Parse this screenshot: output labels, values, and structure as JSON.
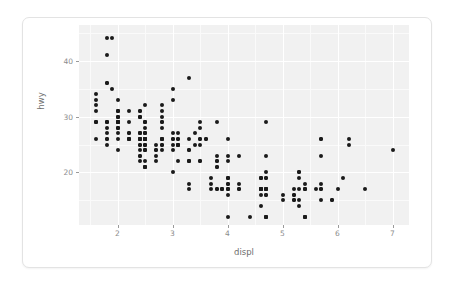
{
  "chart_data": {
    "type": "scatter",
    "title": "",
    "xlabel": "displ",
    "ylabel": "hwy",
    "xlim": [
      1.3,
      7.3
    ],
    "ylim": [
      10.6,
      46.4
    ],
    "xticks": [
      2,
      3,
      4,
      5,
      6,
      7
    ],
    "yticks": [
      20,
      30,
      40
    ],
    "xtick_labels": [
      "2",
      "3",
      "4",
      "5",
      "6",
      "7"
    ],
    "ytick_labels": [
      "20",
      "30",
      "40"
    ],
    "grid": true,
    "legend": "none",
    "panel_background": "#f1f1f1",
    "grid_color": "#ffffff",
    "point_color": "#1a1a1a",
    "point_count": 234,
    "points": [
      [
        1.8,
        29
      ],
      [
        1.8,
        29
      ],
      [
        2.0,
        31
      ],
      [
        2.0,
        30
      ],
      [
        2.8,
        26
      ],
      [
        2.8,
        26
      ],
      [
        3.1,
        27
      ],
      [
        1.8,
        26
      ],
      [
        1.8,
        25
      ],
      [
        2.0,
        28
      ],
      [
        2.0,
        27
      ],
      [
        2.8,
        25
      ],
      [
        2.8,
        25
      ],
      [
        3.1,
        25
      ],
      [
        3.1,
        25
      ],
      [
        2.8,
        24
      ],
      [
        3.1,
        25
      ],
      [
        4.2,
        23
      ],
      [
        5.3,
        20
      ],
      [
        5.3,
        15
      ],
      [
        5.3,
        20
      ],
      [
        5.7,
        17
      ],
      [
        6.0,
        17
      ],
      [
        5.7,
        26
      ],
      [
        5.7,
        23
      ],
      [
        6.2,
        26
      ],
      [
        6.2,
        25
      ],
      [
        7.0,
        24
      ],
      [
        5.3,
        19
      ],
      [
        5.3,
        14
      ],
      [
        5.7,
        15
      ],
      [
        6.5,
        17
      ],
      [
        2.4,
        27
      ],
      [
        2.4,
        30
      ],
      [
        3.1,
        26
      ],
      [
        3.5,
        29
      ],
      [
        3.6,
        26
      ],
      [
        2.4,
        24
      ],
      [
        3.0,
        24
      ],
      [
        3.3,
        22
      ],
      [
        3.3,
        22
      ],
      [
        3.3,
        24
      ],
      [
        3.3,
        24
      ],
      [
        3.3,
        17
      ],
      [
        3.8,
        22
      ],
      [
        3.8,
        21
      ],
      [
        3.8,
        23
      ],
      [
        4.0,
        23
      ],
      [
        3.7,
        19
      ],
      [
        3.7,
        18
      ],
      [
        3.9,
        17
      ],
      [
        3.9,
        17
      ],
      [
        4.7,
        19
      ],
      [
        4.7,
        19
      ],
      [
        4.7,
        12
      ],
      [
        5.2,
        17
      ],
      [
        5.2,
        15
      ],
      [
        3.9,
        17
      ],
      [
        4.7,
        17
      ],
      [
        4.7,
        12
      ],
      [
        4.7,
        17
      ],
      [
        5.2,
        16
      ],
      [
        5.7,
        18
      ],
      [
        5.9,
        15
      ],
      [
        4.7,
        16
      ],
      [
        4.7,
        12
      ],
      [
        4.7,
        17
      ],
      [
        4.7,
        17
      ],
      [
        4.7,
        16
      ],
      [
        4.7,
        12
      ],
      [
        5.2,
        15
      ],
      [
        5.2,
        16
      ],
      [
        5.7,
        17
      ],
      [
        5.9,
        15
      ],
      [
        4.6,
        17
      ],
      [
        5.4,
        17
      ],
      [
        5.4,
        18
      ],
      [
        4.0,
        17
      ],
      [
        4.0,
        19
      ],
      [
        4.0,
        17
      ],
      [
        4.0,
        12
      ],
      [
        4.6,
        17
      ],
      [
        5.0,
        16
      ],
      [
        4.2,
        18
      ],
      [
        4.2,
        17
      ],
      [
        4.6,
        17
      ],
      [
        4.6,
        16
      ],
      [
        4.6,
        17
      ],
      [
        5.4,
        12
      ],
      [
        5.4,
        17
      ],
      [
        3.8,
        17
      ],
      [
        3.8,
        17
      ],
      [
        4.0,
        17
      ],
      [
        4.0,
        18
      ],
      [
        4.6,
        19
      ],
      [
        4.6,
        17
      ],
      [
        4.6,
        19
      ],
      [
        4.6,
        19
      ],
      [
        5.4,
        17
      ],
      [
        1.6,
        29
      ],
      [
        1.6,
        29
      ],
      [
        1.6,
        31
      ],
      [
        1.6,
        29
      ],
      [
        1.6,
        26
      ],
      [
        1.8,
        28
      ],
      [
        1.8,
        27
      ],
      [
        2.0,
        24
      ],
      [
        2.4,
        25
      ],
      [
        2.4,
        23
      ],
      [
        2.4,
        26
      ],
      [
        2.4,
        23
      ],
      [
        2.5,
        26
      ],
      [
        2.5,
        26
      ],
      [
        3.3,
        26
      ],
      [
        2.0,
        29
      ],
      [
        2.0,
        31
      ],
      [
        2.0,
        31
      ],
      [
        2.0,
        30
      ],
      [
        2.7,
        23
      ],
      [
        2.7,
        24
      ],
      [
        2.7,
        22
      ],
      [
        3.0,
        20
      ],
      [
        3.7,
        17
      ],
      [
        4.0,
        19
      ],
      [
        4.7,
        20
      ],
      [
        4.7,
        17
      ],
      [
        4.7,
        29
      ],
      [
        5.7,
        26
      ],
      [
        6.1,
        19
      ],
      [
        4.0,
        16
      ],
      [
        4.2,
        17
      ],
      [
        4.4,
        12
      ],
      [
        4.6,
        17
      ],
      [
        5.4,
        12
      ],
      [
        5.4,
        12
      ],
      [
        5.4,
        12
      ],
      [
        4.0,
        19
      ],
      [
        4.0,
        18
      ],
      [
        4.6,
        14
      ],
      [
        5.0,
        15
      ],
      [
        2.4,
        27
      ],
      [
        2.4,
        22
      ],
      [
        2.5,
        24
      ],
      [
        2.5,
        29
      ],
      [
        3.5,
        26
      ],
      [
        3.5,
        22
      ],
      [
        3.0,
        27
      ],
      [
        3.0,
        25
      ],
      [
        3.5,
        22
      ],
      [
        3.3,
        22
      ],
      [
        3.3,
        18
      ],
      [
        4.0,
        22
      ],
      [
        5.6,
        17
      ],
      [
        3.1,
        22
      ],
      [
        3.8,
        21
      ],
      [
        3.8,
        29
      ],
      [
        3.8,
        22
      ],
      [
        5.3,
        17
      ],
      [
        2.5,
        24
      ],
      [
        2.5,
        22
      ],
      [
        2.5,
        21
      ],
      [
        2.5,
        21
      ],
      [
        2.5,
        21
      ],
      [
        2.5,
        21
      ],
      [
        2.2,
        27
      ],
      [
        2.2,
        26
      ],
      [
        2.5,
        27
      ],
      [
        2.5,
        26
      ],
      [
        2.5,
        25
      ],
      [
        2.5,
        25
      ],
      [
        2.5,
        27
      ],
      [
        2.5,
        26
      ],
      [
        2.5,
        27
      ],
      [
        2.5,
        26
      ],
      [
        2.7,
        25
      ],
      [
        2.7,
        24
      ],
      [
        3.4,
        27
      ],
      [
        3.4,
        25
      ],
      [
        4.0,
        26
      ],
      [
        4.7,
        23
      ],
      [
        2.2,
        26
      ],
      [
        2.2,
        26
      ],
      [
        2.4,
        26
      ],
      [
        2.4,
        26
      ],
      [
        3.0,
        26
      ],
      [
        3.0,
        26
      ],
      [
        3.5,
        25
      ],
      [
        2.2,
        29
      ],
      [
        2.2,
        31
      ],
      [
        2.4,
        31
      ],
      [
        2.4,
        30
      ],
      [
        3.0,
        33
      ],
      [
        3.0,
        35
      ],
      [
        3.3,
        37
      ],
      [
        1.8,
        41
      ],
      [
        1.8,
        44
      ],
      [
        1.8,
        29
      ],
      [
        1.8,
        26
      ],
      [
        2.0,
        29
      ],
      [
        2.0,
        28
      ],
      [
        2.8,
        29
      ],
      [
        2.8,
        28
      ],
      [
        3.6,
        26
      ],
      [
        2.2,
        27
      ],
      [
        2.2,
        26
      ],
      [
        2.4,
        26
      ],
      [
        2.4,
        25
      ],
      [
        2.5,
        25
      ],
      [
        2.5,
        24
      ],
      [
        2.8,
        26
      ],
      [
        2.8,
        26
      ],
      [
        3.1,
        26
      ],
      [
        3.1,
        25
      ],
      [
        1.9,
        44
      ],
      [
        2.0,
        29
      ],
      [
        2.0,
        26
      ],
      [
        2.0,
        28
      ],
      [
        2.0,
        29
      ],
      [
        2.5,
        29
      ],
      [
        2.5,
        28
      ],
      [
        2.8,
        31
      ],
      [
        2.8,
        32
      ],
      [
        1.9,
        35
      ],
      [
        2.0,
        33
      ],
      [
        2.0,
        30
      ],
      [
        2.0,
        29
      ],
      [
        2.5,
        32
      ],
      [
        2.5,
        29
      ],
      [
        2.8,
        30
      ],
      [
        2.8,
        29
      ],
      [
        1.6,
        33
      ],
      [
        1.6,
        32
      ],
      [
        1.6,
        34
      ],
      [
        1.8,
        36
      ],
      [
        1.8,
        36
      ],
      [
        2.0,
        29
      ],
      [
        2.4,
        26
      ],
      [
        2.4,
        27
      ],
      [
        2.4,
        30
      ],
      [
        2.4,
        31
      ],
      [
        2.5,
        26
      ],
      [
        2.5,
        26
      ],
      [
        3.5,
        28
      ],
      [
        3.5,
        26
      ]
    ]
  },
  "xticks_display": [
    {
      "value": 2,
      "label": "2"
    },
    {
      "value": 3,
      "label": "3"
    },
    {
      "value": 4,
      "label": "4"
    },
    {
      "value": 5,
      "label": "5"
    },
    {
      "value": 6,
      "label": "6"
    },
    {
      "value": 7,
      "label": "7"
    }
  ],
  "yticks_display": [
    {
      "value": 20,
      "label": "20"
    },
    {
      "value": 30,
      "label": "30"
    },
    {
      "value": 40,
      "label": "40"
    }
  ]
}
